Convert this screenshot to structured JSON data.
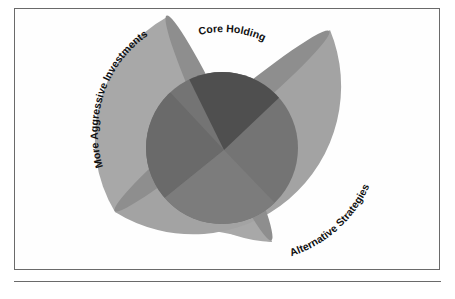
{
  "diagram": {
    "type": "overlapping-shapes",
    "labels": {
      "core": "Core Holding",
      "aggressive": "More Aggressive Investments",
      "alternative": "Alternative Strategies"
    },
    "colors": {
      "outer": "#a6a6a6",
      "lens": "#8c8c8c",
      "core": "#707070",
      "core_top": "#4e4e4e",
      "frame": "#6a6a6a",
      "text": "#111111"
    }
  }
}
